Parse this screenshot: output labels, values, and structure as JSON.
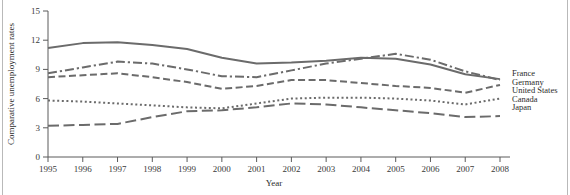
{
  "figure": {
    "background_color": "#ffffff",
    "line_color": "#6b6b6b",
    "axis_color": "#5a5a5a"
  },
  "chart_data": {
    "type": "line",
    "title": "",
    "xlabel": "Year",
    "ylabel": "Comparative unemployment rates",
    "x": [
      1995,
      1996,
      1997,
      1998,
      1999,
      2000,
      2001,
      2002,
      2003,
      2004,
      2005,
      2006,
      2007,
      2008
    ],
    "xtick_labels": [
      "1995",
      "1996",
      "1997",
      "1998",
      "1999",
      "2000",
      "2001",
      "2002",
      "2003",
      "2004",
      "2005",
      "2006",
      "2007",
      "2008"
    ],
    "ytick_labels": [
      "0",
      "3",
      "6",
      "9",
      "12",
      "15"
    ],
    "yticks": [
      0,
      3,
      6,
      9,
      12,
      15
    ],
    "xlim": [
      1995,
      2008
    ],
    "ylim": [
      0,
      15
    ],
    "grid": false,
    "legend_position": "right-inline",
    "series": [
      {
        "name": "France",
        "line_style": "solid",
        "values": [
          11.2,
          11.7,
          11.8,
          11.5,
          11.1,
          10.2,
          9.6,
          9.7,
          9.9,
          10.2,
          10.1,
          9.5,
          8.5,
          8.0
        ]
      },
      {
        "name": "Germany",
        "line_style": "dash-dot",
        "values": [
          8.6,
          9.2,
          9.8,
          9.6,
          9.0,
          8.3,
          8.2,
          8.9,
          9.6,
          10.1,
          10.6,
          10.0,
          8.8,
          7.9
        ]
      },
      {
        "name": "United States",
        "line_style": "dashed",
        "values": [
          8.2,
          8.4,
          8.6,
          8.2,
          7.7,
          7.0,
          7.3,
          7.9,
          7.9,
          7.6,
          7.3,
          7.1,
          6.6,
          7.4
        ]
      },
      {
        "name": "Canada",
        "line_style": "dotted",
        "values": [
          5.8,
          5.7,
          5.5,
          5.3,
          5.1,
          5.0,
          5.5,
          6.0,
          6.1,
          6.1,
          6.0,
          5.8,
          5.4,
          6.0
        ]
      },
      {
        "name": "Japan",
        "line_style": "long-dash",
        "values": [
          3.2,
          3.3,
          3.4,
          4.1,
          4.7,
          4.8,
          5.1,
          5.5,
          5.4,
          5.1,
          4.8,
          4.5,
          4.1,
          4.2
        ]
      }
    ]
  }
}
